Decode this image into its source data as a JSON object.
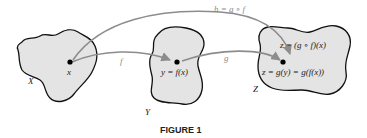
{
  "figure": {
    "caption": "FIGURE 1",
    "colors": {
      "region_fill": "#e4e4e4",
      "region_stroke": "#111111",
      "arrow": "#8c8c8c",
      "arrow_label": "#8c8c8c",
      "text": "#222222",
      "point": "#000000"
    },
    "sets": [
      {
        "name": "X",
        "label": "X"
      },
      {
        "name": "Y",
        "label": "Y"
      },
      {
        "name": "Z",
        "label": "Z"
      }
    ],
    "points": {
      "x": "x",
      "y": "y = f(x)",
      "z_top": "z = (g ∘ f)(x)",
      "z_bottom": "z = g(y) = g(f(x))"
    },
    "arrows": {
      "f": "f",
      "g": "g",
      "h": "h = g ∘ f"
    }
  }
}
